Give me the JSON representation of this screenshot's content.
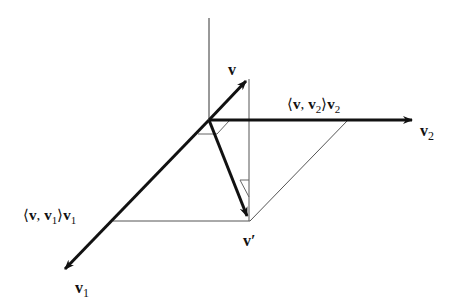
{
  "diagram": {
    "labels": {
      "v": "v",
      "v1": "v",
      "v1_sub": "1",
      "v2": "v",
      "v2_sub": "2",
      "v_prime": "v′",
      "proj1_open": "⟨",
      "proj1_v": "v",
      "proj1_comma": ",",
      "proj1_v1": "v",
      "proj1_sub": "1",
      "proj1_close": "⟩",
      "proj1_vec": "v",
      "proj1_vec_sub": "1",
      "proj2_open": "⟨",
      "proj2_v": "v",
      "proj2_comma": ",",
      "proj2_v2": "v",
      "proj2_sub": "2",
      "proj2_close": "⟩",
      "proj2_vec": "v",
      "proj2_vec_sub": "2"
    },
    "colors": {
      "stroke": "#111111",
      "thin": "#555555"
    }
  }
}
